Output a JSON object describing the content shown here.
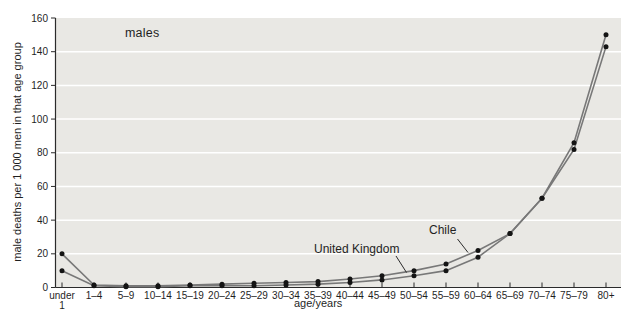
{
  "figure": {
    "panel_label": "males",
    "y_axis_title": "male deaths per 1 000 men in that age group",
    "x_axis_title": "age/years"
  },
  "annotations": {
    "united_kingdom_label": "United Kingdom",
    "chile_label": "Chile"
  },
  "colors": {
    "plot_background": "#e9e8e4",
    "gridline": "#ffffff",
    "axis": "#2b2b2b",
    "series_line": "#787878",
    "data_point": "#141414",
    "text": "#1f1f1f"
  },
  "chart_data": {
    "type": "line",
    "title": "males",
    "xlabel": "age/years",
    "ylabel": "male deaths per 1 000 men in that age group",
    "ylim": [
      0,
      160
    ],
    "ytick_step": 20,
    "grid": true,
    "grid_color": "white",
    "legend_position": "inline-annotations",
    "categories": [
      "under 1",
      "1–4",
      "5–9",
      "10–14",
      "15–19",
      "20–24",
      "25–29",
      "30–34",
      "35–39",
      "40–44",
      "45–49",
      "50–54",
      "55–59",
      "60–64",
      "65–69",
      "70–74",
      "75–79",
      "80+"
    ],
    "series": [
      {
        "name": "Chile",
        "values": [
          20,
          1.5,
          1,
          1,
          1.5,
          2,
          2.5,
          3,
          3.5,
          5,
          7,
          10,
          14,
          22,
          32,
          53,
          86,
          150
        ]
      },
      {
        "name": "United Kingdom",
        "values": [
          10,
          1,
          0.5,
          0.5,
          1,
          1,
          1,
          1.5,
          2,
          3,
          4.5,
          7,
          10,
          18,
          32,
          53,
          82,
          143
        ]
      }
    ]
  }
}
